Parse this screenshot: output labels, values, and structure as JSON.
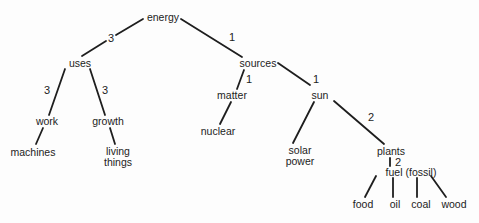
{
  "diagram": {
    "nodes": {
      "energy": {
        "label": "energy",
        "x": 163,
        "y": 17
      },
      "uses": {
        "label": "uses",
        "x": 80,
        "y": 63
      },
      "sources": {
        "label": "sources",
        "x": 258,
        "y": 63
      },
      "work": {
        "label": "work",
        "x": 47,
        "y": 121
      },
      "growth": {
        "label": "growth",
        "x": 108,
        "y": 121
      },
      "machines": {
        "label": "machines",
        "x": 33,
        "y": 152
      },
      "living_things": {
        "label": "living things",
        "line1": "living",
        "line2": "things",
        "x": 118,
        "y": 157
      },
      "matter": {
        "label": "matter",
        "x": 232,
        "y": 95
      },
      "nuclear": {
        "label": "nuclear",
        "x": 218,
        "y": 131
      },
      "sun": {
        "label": "sun",
        "x": 320,
        "y": 95
      },
      "solar_power": {
        "label": "solar power",
        "line1": "solar",
        "line2": "power",
        "x": 300,
        "y": 156
      },
      "plants": {
        "label": "plants",
        "x": 391,
        "y": 151
      },
      "fuel_fossil": {
        "label": "fuel (fossil)",
        "x": 411,
        "y": 172
      },
      "food": {
        "label": "food",
        "x": 363,
        "y": 204
      },
      "oil": {
        "label": "oil",
        "x": 395,
        "y": 204
      },
      "coal": {
        "label": "coal",
        "x": 421,
        "y": 204
      },
      "wood": {
        "label": "wood",
        "x": 454,
        "y": 204
      }
    },
    "edges": [
      {
        "from": "energy",
        "to": "uses",
        "weight": "3"
      },
      {
        "from": "energy",
        "to": "sources",
        "weight": "1"
      },
      {
        "from": "uses",
        "to": "work",
        "weight": "3"
      },
      {
        "from": "uses",
        "to": "growth",
        "weight": "3"
      },
      {
        "from": "work",
        "to": "machines",
        "weight": ""
      },
      {
        "from": "growth",
        "to": "living_things",
        "weight": ""
      },
      {
        "from": "sources",
        "to": "matter",
        "weight": "1"
      },
      {
        "from": "sources",
        "to": "sun",
        "weight": "1"
      },
      {
        "from": "matter",
        "to": "nuclear",
        "weight": ""
      },
      {
        "from": "sun",
        "to": "solar_power",
        "weight": ""
      },
      {
        "from": "sun",
        "to": "plants",
        "weight": "2"
      },
      {
        "from": "plants",
        "to": "fuel_fossil",
        "weight": "2"
      },
      {
        "from": "fuel_fossil",
        "to": "food",
        "weight": ""
      },
      {
        "from": "fuel_fossil",
        "to": "oil",
        "weight": ""
      },
      {
        "from": "fuel_fossil",
        "to": "coal",
        "weight": ""
      },
      {
        "from": "fuel_fossil",
        "to": "wood",
        "weight": ""
      }
    ],
    "weights": {
      "energy_uses": "3",
      "energy_sources": "1",
      "uses_work": "3",
      "uses_growth": "3",
      "sources_matter": "1",
      "sources_sun": "1",
      "sun_plants": "2",
      "plants_fuel": "2"
    }
  }
}
